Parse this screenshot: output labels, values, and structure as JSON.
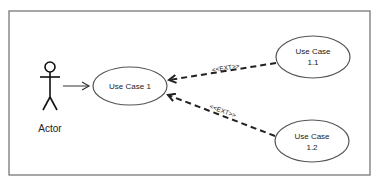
{
  "diagram": {
    "type": "uml-use-case",
    "actor": {
      "label": "Actor"
    },
    "use_cases": [
      {
        "id": "uc1",
        "lines": [
          "Use Case 1"
        ]
      },
      {
        "id": "uc11",
        "lines": [
          "Use Case",
          "1.1"
        ]
      },
      {
        "id": "uc12",
        "lines": [
          "Use Case",
          "1.2"
        ]
      }
    ],
    "relations": [
      {
        "from": "actor",
        "to": "uc1",
        "style": "solid-arrow",
        "label": ""
      },
      {
        "from": "uc11",
        "to": "uc1",
        "style": "dashed-arrow",
        "label": "<<EXT>>"
      },
      {
        "from": "uc12",
        "to": "uc1",
        "style": "dashed-arrow",
        "label": "<<EXT>>"
      }
    ],
    "colors": {
      "line": "#333333",
      "frame": "#777777",
      "background": "#ffffff"
    }
  }
}
